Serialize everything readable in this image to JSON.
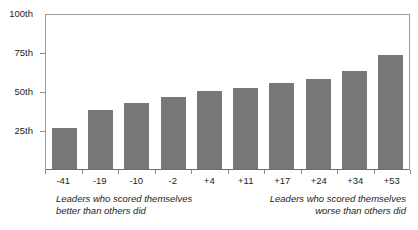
{
  "chart_data": {
    "type": "bar",
    "title": "",
    "subtitle": "",
    "xlabel": "",
    "ylabel": "",
    "categories": [
      "-41",
      "-19",
      "-10",
      "-2",
      "+4",
      "+11",
      "+17",
      "+24",
      "+34",
      "+53"
    ],
    "values": [
      26,
      38,
      42,
      46,
      50,
      52,
      55,
      58,
      63,
      73
    ],
    "ylim": [
      0,
      100
    ],
    "ytick_values": [
      25,
      50,
      75,
      100
    ],
    "ytick_labels": [
      "25th",
      "50th",
      "75th",
      "100th"
    ],
    "grid": false,
    "legend": null,
    "bar_color": "#787878",
    "axis_color": "#9a9a9a",
    "text_color": "#231f20",
    "annotations": [
      {
        "name": "left-caption",
        "text": "Leaders who scored themselves\nbetter than others did",
        "position": "below-axis-left",
        "style": "italic"
      },
      {
        "name": "right-caption",
        "text": "Leaders who scored themselves\nworse than others did",
        "position": "below-axis-right",
        "style": "italic"
      }
    ]
  },
  "axes": {
    "y": {
      "labels": [
        {
          "label": "100th",
          "value": 100
        },
        {
          "label": "75th",
          "value": 75
        },
        {
          "label": "50th",
          "value": 50
        },
        {
          "label": "25th",
          "value": 25
        }
      ]
    },
    "x": {
      "labels": [
        "-41",
        "-19",
        "-10",
        "-2",
        "+4",
        "+11",
        "+17",
        "+24",
        "+34",
        "+53"
      ]
    }
  },
  "captions": {
    "left": "Leaders who scored themselves\nbetter than others did",
    "right": "Leaders who scored themselves\nworse than others did"
  }
}
